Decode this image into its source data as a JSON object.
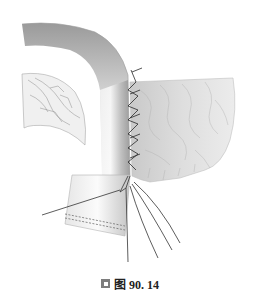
{
  "figure": {
    "caption": {
      "icon": "figure-marker-icon",
      "label": "图 90. 14"
    },
    "colors": {
      "background": "#ffffff",
      "tube_dark": "#8a8a8a",
      "tube_light": "#f2f2f2",
      "suture": "#2a2a2a",
      "caption_text": "#222222",
      "caption_icon": "#7d7d7d"
    }
  }
}
